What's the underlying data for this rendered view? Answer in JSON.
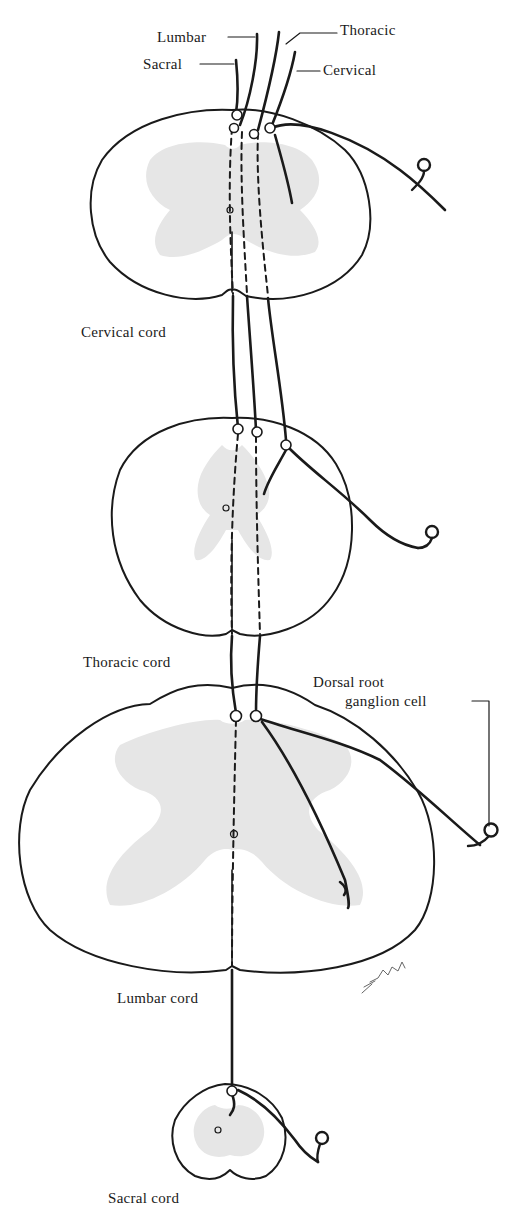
{
  "diagram": {
    "type": "anatomical-illustration",
    "colors": {
      "ink": "#1a1a1a",
      "gray_matter": "#e6e6e6",
      "background": "#ffffff"
    },
    "fiber_labels": {
      "lumbar": "Lumbar",
      "thoracic": "Thoracic",
      "sacral": "Sacral",
      "cervical": "Cervical"
    },
    "section_labels": {
      "cervical": "Cervical cord",
      "thoracic": "Thoracic cord",
      "lumbar": "Lumbar cord",
      "sacral": "Sacral cord"
    },
    "ganglion_label_line1": "Dorsal root",
    "ganglion_label_line2": "ganglion cell",
    "signature": "ENNU"
  }
}
